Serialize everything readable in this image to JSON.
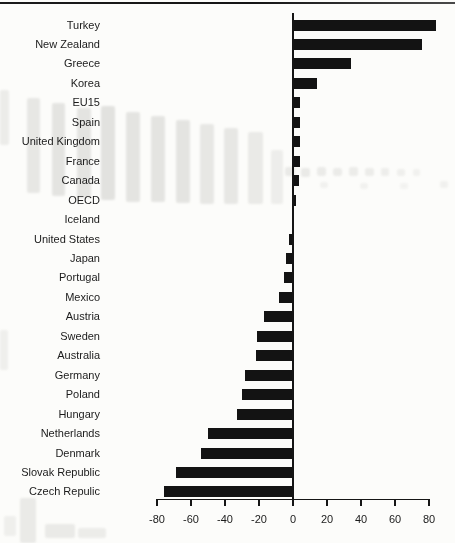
{
  "chart_data": {
    "type": "bar",
    "orientation": "horizontal",
    "title": "",
    "xlabel": "",
    "ylabel": "",
    "xlim": [
      -80,
      80
    ],
    "x_ticks": [
      "-80",
      "-60",
      "-40",
      "-20",
      "0",
      "20",
      "40",
      "60",
      "80"
    ],
    "grid": false,
    "legend": null,
    "bar_color": "#131313",
    "axis_color": "#151515",
    "categories": [
      "Turkey",
      "New Zealand",
      "Greece",
      "Korea",
      "EU15",
      "Spain",
      "United Kingdom",
      "France",
      "Canada",
      "OECD",
      "Iceland",
      "United States",
      "Japan",
      "Portugal",
      "Mexico",
      "Austria",
      "Sweden",
      "Australia",
      "Germany",
      "Poland",
      "Hungary",
      "Netherlands",
      "Denmark",
      "Slovak Republic",
      "Czech Repulic"
    ],
    "values": [
      84,
      76,
      34,
      14,
      4,
      4,
      4,
      4,
      3.5,
      1.5,
      0.5,
      -2.5,
      -4,
      -5.5,
      -8,
      -17,
      -21,
      -22,
      -28,
      -30,
      -33,
      -50,
      -54,
      -69,
      -76
    ]
  }
}
